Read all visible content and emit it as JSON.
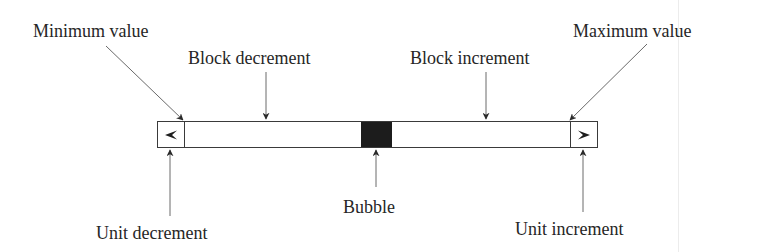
{
  "diagram": {
    "labels": {
      "minimum_value": "Minimum value",
      "maximum_value": "Maximum value",
      "block_decrement": "Block decrement",
      "block_increment": "Block increment",
      "unit_decrement": "Unit decrement",
      "unit_increment": "Unit increment",
      "bubble": "Bubble"
    },
    "icons": {
      "unit_decrement_glyph": "left-arrowhead",
      "unit_increment_glyph": "right-arrowhead"
    },
    "colors": {
      "outline": "#3a3a3a",
      "bubble": "#1c1c1c",
      "text": "#262626",
      "background": "#ffffff"
    }
  }
}
